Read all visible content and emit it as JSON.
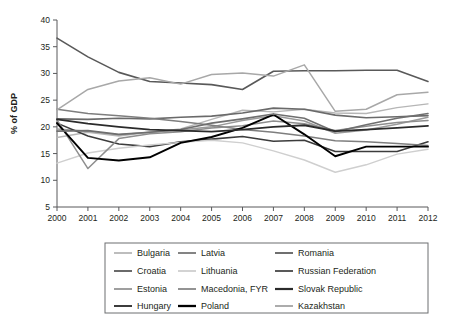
{
  "chart_data": {
    "type": "line",
    "title": "",
    "xlabel": "",
    "ylabel": "% of GDP",
    "x": [
      2000,
      2001,
      2002,
      2003,
      2004,
      2005,
      2006,
      2007,
      2008,
      2009,
      2010,
      2011,
      2012
    ],
    "xtick_labels": [
      "2000",
      "2001",
      "2002",
      "2003",
      "2004",
      "2005",
      "2006",
      "2007",
      "2008",
      "2009",
      "2010",
      "2011",
      "2012"
    ],
    "ytick_labels": [
      "5",
      "10",
      "15",
      "20",
      "25",
      "30",
      "35",
      "40"
    ],
    "yticks": [
      5,
      10,
      15,
      20,
      25,
      30,
      35,
      40
    ],
    "xlim": [
      2000,
      2012
    ],
    "ylim": [
      5,
      40
    ],
    "grid": false,
    "legend_position": "bottom",
    "legend_columns": 3,
    "series": [
      {
        "name": "Bulgaria",
        "color": "#b6b6b6",
        "width": 1.4,
        "values": [
          18.0,
          19.0,
          18.3,
          19.0,
          19.6,
          21.4,
          23.1,
          22.8,
          23.3,
          22.6,
          22.5,
          23.6,
          24.3
        ]
      },
      {
        "name": "Croatia",
        "color": "#6a6a6a",
        "width": 1.6,
        "values": [
          21.5,
          21.4,
          21.6,
          21.5,
          21.8,
          22.0,
          22.6,
          23.5,
          23.3,
          22.2,
          21.7,
          21.9,
          22.1
        ]
      },
      {
        "name": "Estonia",
        "color": "#9a9a9a",
        "width": 1.5,
        "values": [
          19.6,
          19.2,
          18.5,
          19.0,
          19.4,
          20.0,
          21.2,
          22.1,
          21.1,
          18.8,
          19.4,
          20.5,
          21.8
        ]
      },
      {
        "name": "Hungary",
        "color": "#3c3c3c",
        "width": 1.6,
        "values": [
          20.7,
          18.3,
          16.8,
          16.3,
          17.2,
          17.7,
          18.2,
          17.3,
          17.5,
          15.4,
          15.4,
          15.4,
          17.2
        ]
      },
      {
        "name": "Latvia",
        "color": "#7e7e7e",
        "width": 1.5,
        "values": [
          23.3,
          22.5,
          22.1,
          21.6,
          21.0,
          20.3,
          19.5,
          19.0,
          18.3,
          17.4,
          17.2,
          16.9,
          16.5
        ]
      },
      {
        "name": "Lithuania",
        "color": "#cfcfcf",
        "width": 1.4,
        "values": [
          13.2,
          15.1,
          16.0,
          16.6,
          17.1,
          17.5,
          17.0,
          15.5,
          13.8,
          11.5,
          12.9,
          14.9,
          15.8
        ]
      },
      {
        "name": "Macedonia, FYR",
        "color": "#8e8e8e",
        "width": 1.5,
        "values": [
          21.3,
          12.2,
          17.8,
          18.7,
          19.1,
          19.8,
          20.2,
          21.1,
          20.6,
          19.3,
          20.1,
          20.8,
          21.2
        ]
      },
      {
        "name": "Poland",
        "color": "#000000",
        "width": 1.9,
        "values": [
          20.7,
          14.2,
          13.7,
          14.3,
          17.0,
          18.1,
          19.8,
          22.3,
          18.6,
          14.5,
          16.3,
          16.3,
          16.3
        ]
      },
      {
        "name": "Romania",
        "color": "#6f6f6f",
        "width": 1.6,
        "values": [
          19.2,
          19.3,
          18.6,
          19.0,
          19.5,
          20.7,
          21.5,
          22.4,
          21.6,
          19.1,
          20.4,
          21.6,
          22.5
        ]
      },
      {
        "name": "Russian Federation",
        "color": "#595959",
        "width": 1.6,
        "values": [
          36.6,
          33.1,
          30.2,
          28.5,
          28.2,
          27.9,
          27.0,
          30.4,
          30.5,
          30.5,
          30.6,
          30.6,
          28.5
        ]
      },
      {
        "name": "Slovak Republic",
        "color": "#2b2b2b",
        "width": 1.8,
        "values": [
          21.4,
          20.6,
          20.0,
          19.5,
          19.3,
          19.1,
          19.5,
          20.0,
          20.3,
          19.2,
          19.5,
          19.8,
          20.2
        ]
      },
      {
        "name": "Kazakhstan",
        "color": "#a8a8a8",
        "width": 1.5,
        "values": [
          23.2,
          27.0,
          28.6,
          29.2,
          28.0,
          29.8,
          30.1,
          29.5,
          31.6,
          22.9,
          23.3,
          26.0,
          26.5
        ]
      }
    ]
  },
  "legend": {
    "items": [
      {
        "label": "Bulgaria"
      },
      {
        "label": "Latvia"
      },
      {
        "label": "Romania"
      },
      {
        "label": "Croatia"
      },
      {
        "label": "Lithuania"
      },
      {
        "label": "Russian Federation"
      },
      {
        "label": "Estonia"
      },
      {
        "label": "Macedonia, FYR"
      },
      {
        "label": "Slovak Republic"
      },
      {
        "label": "Hungary"
      },
      {
        "label": "Poland"
      },
      {
        "label": "Kazakhstan"
      }
    ],
    "order": [
      "Bulgaria",
      "Latvia",
      "Romania",
      "Croatia",
      "Lithuania",
      "Russian Federation",
      "Estonia",
      "Macedonia, FYR",
      "Slovak Republic",
      "Hungary",
      "Poland",
      "Kazakhstan"
    ]
  }
}
